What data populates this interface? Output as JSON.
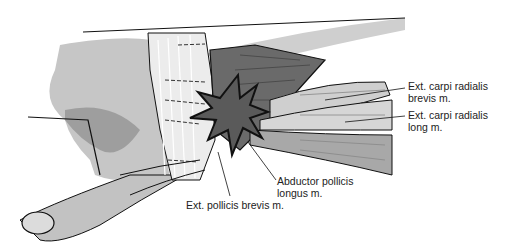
{
  "diagram": {
    "labels": [
      {
        "id": "ecrb",
        "line1": "Ext. carpi radialis",
        "line2": "brevis m."
      },
      {
        "id": "ecrl",
        "line1": "Ext. carpi radialis",
        "line2": "long m."
      },
      {
        "id": "apl",
        "line1": "Abductor pollicis",
        "line2": "longus m."
      },
      {
        "id": "epb",
        "line1": "Ext. pollicis brevis m.",
        "line2": ""
      }
    ],
    "colors": {
      "skin": "#c8c8c8",
      "skin_shadow": "#9a9a9a",
      "muscle_dark": "#6a6a6a",
      "tendon_light": "#e6e6e6",
      "outline": "#111111",
      "starburst": "#555555"
    }
  }
}
